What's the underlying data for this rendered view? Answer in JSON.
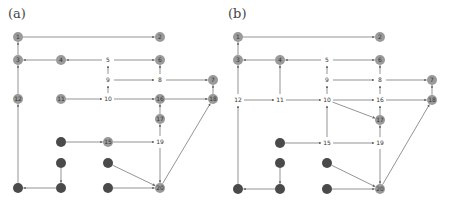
{
  "panels": [
    {
      "label": "(a)",
      "offset_x": 0,
      "nodes": [
        {
          "id": "1",
          "x": 18,
          "y": 37,
          "style": "gray"
        },
        {
          "id": "2",
          "x": 160,
          "y": 37,
          "style": "gray"
        },
        {
          "id": "3",
          "x": 18,
          "y": 60,
          "style": "gray"
        },
        {
          "id": "4",
          "x": 61,
          "y": 60,
          "style": "gray"
        },
        {
          "id": "5",
          "x": 108,
          "y": 60,
          "style": "text"
        },
        {
          "id": "6",
          "x": 160,
          "y": 60,
          "style": "gray"
        },
        {
          "id": "9",
          "x": 108,
          "y": 80,
          "style": "text"
        },
        {
          "id": "8",
          "x": 160,
          "y": 80,
          "style": "text"
        },
        {
          "id": "7",
          "x": 213,
          "y": 80,
          "style": "gray"
        },
        {
          "id": "12",
          "x": 18,
          "y": 99,
          "style": "gray"
        },
        {
          "id": "11",
          "x": 61,
          "y": 99,
          "style": "gray"
        },
        {
          "id": "10",
          "x": 108,
          "y": 99,
          "style": "text"
        },
        {
          "id": "16",
          "x": 160,
          "y": 99,
          "style": "gray"
        },
        {
          "id": "18",
          "x": 213,
          "y": 99,
          "style": "gray"
        },
        {
          "id": "17",
          "x": 160,
          "y": 119,
          "style": "gray"
        },
        {
          "id": "d1",
          "x": 61,
          "y": 142,
          "style": "dark"
        },
        {
          "id": "15",
          "x": 108,
          "y": 142,
          "style": "gray"
        },
        {
          "id": "19",
          "x": 160,
          "y": 142,
          "style": "text"
        },
        {
          "id": "d2",
          "x": 61,
          "y": 163,
          "style": "dark"
        },
        {
          "id": "d3",
          "x": 108,
          "y": 163,
          "style": "dark"
        },
        {
          "id": "d4",
          "x": 18,
          "y": 188,
          "style": "dark"
        },
        {
          "id": "d5",
          "x": 61,
          "y": 188,
          "style": "dark"
        },
        {
          "id": "d6",
          "x": 108,
          "y": 188,
          "style": "dark"
        },
        {
          "id": "20",
          "x": 160,
          "y": 188,
          "style": "gray"
        }
      ],
      "edges": [
        [
          "1",
          "2"
        ],
        [
          "3",
          "1"
        ],
        [
          "4",
          "3"
        ],
        [
          "5",
          "4"
        ],
        [
          "5",
          "6"
        ],
        [
          "9",
          "5"
        ],
        [
          "9",
          "8"
        ],
        [
          "8",
          "6"
        ],
        [
          "8",
          "7"
        ],
        [
          "12",
          "3"
        ],
        [
          "11",
          "10"
        ],
        [
          "10",
          "9"
        ],
        [
          "10",
          "16"
        ],
        [
          "16",
          "18"
        ],
        [
          "18",
          "7"
        ],
        [
          "17",
          "16"
        ],
        [
          "d1",
          "15"
        ],
        [
          "15",
          "19"
        ],
        [
          "19",
          "17"
        ],
        [
          "19",
          "20"
        ],
        [
          "20",
          "18"
        ],
        [
          "d2",
          "d5"
        ],
        [
          "d5",
          "d4"
        ],
        [
          "d4",
          "12"
        ],
        [
          "d3",
          "20"
        ],
        [
          "d6",
          "20"
        ]
      ]
    },
    {
      "label": "(b)",
      "offset_x": 220,
      "nodes": [
        {
          "id": "1",
          "x": 18,
          "y": 37,
          "style": "gray"
        },
        {
          "id": "2",
          "x": 160,
          "y": 37,
          "style": "gray"
        },
        {
          "id": "3",
          "x": 18,
          "y": 60,
          "style": "gray"
        },
        {
          "id": "4",
          "x": 60,
          "y": 60,
          "style": "gray"
        },
        {
          "id": "5",
          "x": 107,
          "y": 60,
          "style": "text"
        },
        {
          "id": "6",
          "x": 160,
          "y": 60,
          "style": "gray"
        },
        {
          "id": "9",
          "x": 107,
          "y": 80,
          "style": "text"
        },
        {
          "id": "8",
          "x": 160,
          "y": 80,
          "style": "text"
        },
        {
          "id": "7",
          "x": 212,
          "y": 80,
          "style": "gray"
        },
        {
          "id": "12",
          "x": 18,
          "y": 100,
          "style": "text"
        },
        {
          "id": "11",
          "x": 60,
          "y": 100,
          "style": "text"
        },
        {
          "id": "10",
          "x": 107,
          "y": 100,
          "style": "text"
        },
        {
          "id": "16",
          "x": 160,
          "y": 100,
          "style": "text"
        },
        {
          "id": "18",
          "x": 212,
          "y": 100,
          "style": "gray"
        },
        {
          "id": "17",
          "x": 160,
          "y": 120,
          "style": "gray"
        },
        {
          "id": "d1",
          "x": 60,
          "y": 143,
          "style": "dark"
        },
        {
          "id": "15",
          "x": 107,
          "y": 143,
          "style": "text"
        },
        {
          "id": "19",
          "x": 160,
          "y": 143,
          "style": "text"
        },
        {
          "id": "d2",
          "x": 60,
          "y": 163,
          "style": "dark"
        },
        {
          "id": "d3",
          "x": 107,
          "y": 163,
          "style": "dark"
        },
        {
          "id": "d4",
          "x": 18,
          "y": 189,
          "style": "dark"
        },
        {
          "id": "d5",
          "x": 60,
          "y": 189,
          "style": "dark"
        },
        {
          "id": "d6",
          "x": 107,
          "y": 189,
          "style": "dark"
        },
        {
          "id": "20",
          "x": 160,
          "y": 189,
          "style": "gray"
        }
      ],
      "edges": [
        [
          "1",
          "2"
        ],
        [
          "3",
          "1"
        ],
        [
          "4",
          "3"
        ],
        [
          "5",
          "4"
        ],
        [
          "5",
          "6"
        ],
        [
          "9",
          "5"
        ],
        [
          "9",
          "8"
        ],
        [
          "8",
          "6"
        ],
        [
          "8",
          "7"
        ],
        [
          "12",
          "3"
        ],
        [
          "12",
          "11"
        ],
        [
          "11",
          "4"
        ],
        [
          "11",
          "10"
        ],
        [
          "10",
          "9"
        ],
        [
          "10",
          "16"
        ],
        [
          "10",
          "17"
        ],
        [
          "16",
          "8"
        ],
        [
          "16",
          "18"
        ],
        [
          "18",
          "7"
        ],
        [
          "17",
          "16"
        ],
        [
          "d1",
          "15"
        ],
        [
          "15",
          "10"
        ],
        [
          "15",
          "19"
        ],
        [
          "19",
          "17"
        ],
        [
          "19",
          "20"
        ],
        [
          "20",
          "18"
        ],
        [
          "d2",
          "d5"
        ],
        [
          "d5",
          "d4"
        ],
        [
          "d4",
          "12"
        ],
        [
          "d3",
          "20"
        ],
        [
          "d6",
          "20"
        ]
      ]
    }
  ],
  "colors": {
    "gray_node": "#9a9a9a",
    "dark_node": "#4a4a4a",
    "edge": "#666666",
    "label": "#333333"
  }
}
